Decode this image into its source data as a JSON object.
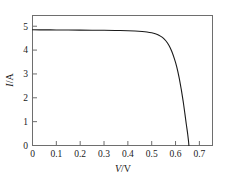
{
  "figure": {
    "background_color": "#ffffff",
    "frame_color": "#6e6e6e",
    "curve_color": "#1a1a1a"
  },
  "chart_data": {
    "type": "line",
    "title": "",
    "subtitle": "",
    "xlabel": "V/V",
    "ylabel": "I/A",
    "xlabel_symbol": "V",
    "xlabel_unit": "/V",
    "ylabel_symbol": "I",
    "ylabel_unit": "/A",
    "xlim": [
      0,
      0.755
    ],
    "ylim": [
      0,
      5.45
    ],
    "xticks": [
      0,
      0.1,
      0.2,
      0.3,
      0.4,
      0.5,
      0.6,
      0.7
    ],
    "xtick_labels": [
      "0",
      "0.1",
      "0.2",
      "0.3",
      "0.4",
      "0.5",
      "0.6",
      "0.7"
    ],
    "yticks": [
      0,
      1,
      2,
      3,
      4,
      5
    ],
    "ytick_labels": [
      "0",
      "1",
      "2",
      "3",
      "4",
      "5"
    ],
    "grid": false,
    "legend": null,
    "legend_position": "none",
    "annotations": [],
    "series": [
      {
        "name": "I-V curve",
        "x": [
          0.0,
          0.05,
          0.1,
          0.15,
          0.2,
          0.25,
          0.3,
          0.35,
          0.4,
          0.43,
          0.46,
          0.48,
          0.5,
          0.515,
          0.53,
          0.545,
          0.56,
          0.572,
          0.584,
          0.595,
          0.605,
          0.615,
          0.624,
          0.632,
          0.639,
          0.645,
          0.65,
          0.654,
          0.656
        ],
        "y": [
          4.85,
          4.848,
          4.845,
          4.842,
          4.838,
          4.834,
          4.829,
          4.822,
          4.81,
          4.798,
          4.778,
          4.758,
          4.725,
          4.685,
          4.625,
          4.53,
          4.38,
          4.2,
          3.95,
          3.64,
          3.3,
          2.85,
          2.35,
          1.85,
          1.35,
          0.9,
          0.55,
          0.22,
          0.0
        ]
      }
    ],
    "short_circuit_current": 4.85,
    "open_circuit_voltage": 0.656
  }
}
